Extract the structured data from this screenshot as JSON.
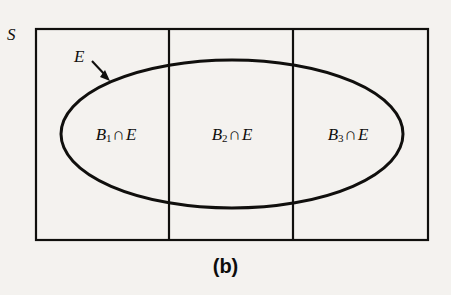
{
  "figure": {
    "caption": "(b)",
    "sample_space_label": "S",
    "event_label": "E",
    "stroke_color": "#100f0d",
    "background_color": "#f4f2ef",
    "partitions": [
      {
        "base": "B",
        "index": "1",
        "operator": "∩",
        "other": "E",
        "text": "B1∩E"
      },
      {
        "base": "B",
        "index": "2",
        "operator": "∩",
        "other": "E",
        "text": "B2∩E"
      },
      {
        "base": "B",
        "index": "3",
        "operator": "∩",
        "other": "E",
        "text": "B3∩E"
      }
    ],
    "geometry": {
      "rect": {
        "x": 36,
        "y": 29,
        "width": 392,
        "height": 211
      },
      "dividers_x": [
        169,
        293
      ],
      "ellipse": {
        "cx": 232,
        "cy": 134,
        "rx": 171,
        "ry": 74
      },
      "arrow": {
        "from_x": 92,
        "from_y": 61,
        "to_x": 110,
        "to_y": 80
      }
    }
  }
}
